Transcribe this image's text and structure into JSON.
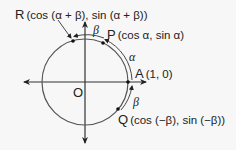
{
  "figure": {
    "type": "unit-circle",
    "colors": {
      "line": "#333333",
      "circle": "#555555",
      "background": "#f7f7f7"
    },
    "origin_label": "O",
    "points": {
      "R": {
        "name": "R",
        "coords": "(cos (α + β), sin (α + β))"
      },
      "P": {
        "name": "P",
        "coords": "(cos α, sin α)"
      },
      "A": {
        "name": "A",
        "coords": "(1, 0)"
      },
      "Q": {
        "name": "Q",
        "coords": "(cos (−β), sin (−β))"
      }
    },
    "angles": {
      "alpha": "α",
      "beta_top": "β",
      "beta_bottom": "β"
    }
  }
}
